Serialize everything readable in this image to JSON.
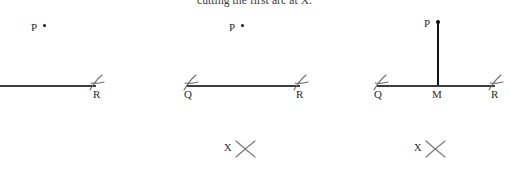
{
  "caption": {
    "text": "cutting the first arc at X."
  },
  "diagrams": [
    {
      "id": "diagram-1",
      "point_label": "P",
      "line_labels": [
        "R"
      ],
      "tick_marks": [
        "R"
      ],
      "has_perpendicular": false,
      "x_mark_label": null
    },
    {
      "id": "diagram-2",
      "point_label": "P",
      "line_labels": [
        "Q",
        "R"
      ],
      "tick_marks": [
        "Q",
        "R"
      ],
      "has_perpendicular": false,
      "x_mark_label": "X"
    },
    {
      "id": "diagram-3",
      "point_label": "P",
      "line_labels": [
        "Q",
        "M",
        "R"
      ],
      "tick_marks": [
        "Q",
        "R"
      ],
      "has_perpendicular": true,
      "x_mark_label": "X"
    }
  ],
  "colors": {
    "line": "#3c3c3c",
    "perpendicular": "#111111",
    "arc_mark": "#6f6f6f",
    "text": "#2b2b2b",
    "background": "#ffffff"
  }
}
